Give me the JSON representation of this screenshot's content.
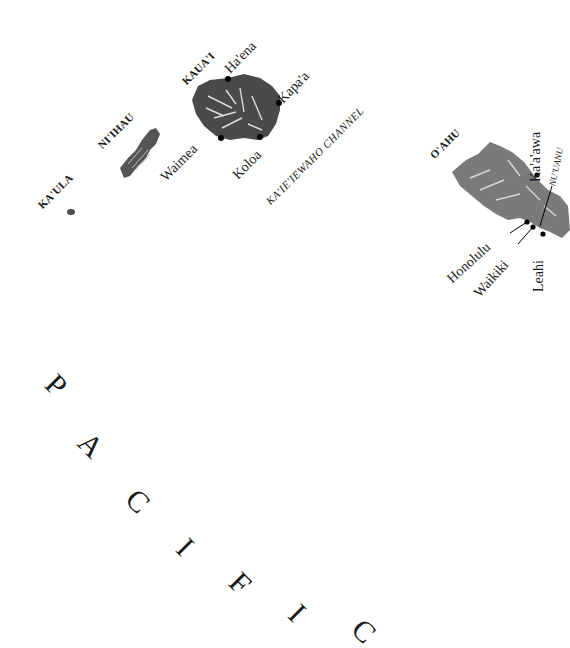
{
  "map": {
    "islands": [
      {
        "name": "KA'ULA"
      },
      {
        "name": "NI'IHAU"
      },
      {
        "name": "KAUA'I"
      },
      {
        "name": "O'AHU"
      }
    ],
    "towns": {
      "haena": "Ha'ena",
      "kapaa": "Kapa'a",
      "waimea": "Waimea",
      "koloa": "Koloa",
      "kaaawa": "Ka'a'awa",
      "honolulu": "Honolulu",
      "waikiki": "Waikiki",
      "leahi": "Leahi"
    },
    "features": {
      "channel": "KA'IE'IEWAHO CHANNEL",
      "ridge": "NU'UANU"
    },
    "ocean_letters": [
      "P",
      "A",
      "C",
      "I",
      "F",
      "I",
      "C"
    ],
    "colors": {
      "background": "#ffffff",
      "land": "#4a4a4a",
      "land_light": "#9a9a9a",
      "text": "#1a1a1a"
    }
  }
}
